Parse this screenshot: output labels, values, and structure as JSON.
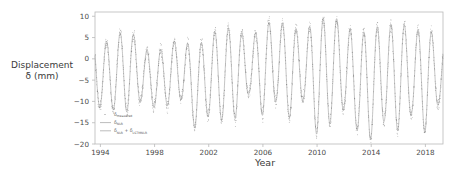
{
  "axes": {
    "ylabel_line1": "Displacement",
    "ylabel_line2": "δ (mm)",
    "xlabel": "Year",
    "yticks": [
      "10",
      "5",
      "0",
      "−5",
      "−10",
      "−15",
      "−20"
    ],
    "xticks": [
      "1994",
      "1998",
      "2002",
      "2006",
      "2010",
      "2014",
      "2018"
    ]
  },
  "legend": {
    "items": [
      {
        "base": "δ",
        "sub": "measured",
        "style": "dot"
      },
      {
        "base": "δ",
        "sub": "NLR",
        "style": "line"
      },
      {
        "base": "δ",
        "sub": "NLR",
        "extra": " + δ",
        "sub2": "LSTMNLR",
        "style": "line"
      }
    ]
  },
  "colors": {
    "axis": "#b9b9b9",
    "tick_text": "#4a4a4a",
    "label_text": "#3a3a3a",
    "fit_line": "#8d8d8d",
    "marker": "#6f6f6f",
    "background": "#ffffff"
  },
  "chart_data": {
    "type": "line",
    "title": "",
    "xlabel": "Year",
    "ylabel": "Displacement δ (mm)",
    "xlim": [
      1993.6,
      2019.3
    ],
    "ylim": [
      -20,
      11
    ],
    "grid": false,
    "legend_position": "lower-left-inside",
    "annual_cycles": [
      {
        "year": 1994,
        "peak": 3.8,
        "trough": -11.5
      },
      {
        "year": 1995,
        "peak": 4.5,
        "trough": -12.0
      },
      {
        "year": 1996,
        "peak": 8.0,
        "trough": -12.5
      },
      {
        "year": 1997,
        "peak": 3.0,
        "trough": -10.0
      },
      {
        "year": 1998,
        "peak": 1.0,
        "trough": -11.5
      },
      {
        "year": 1999,
        "peak": 3.5,
        "trough": -11.0
      },
      {
        "year": 2000,
        "peak": 5.0,
        "trough": -9.5
      },
      {
        "year": 2001,
        "peak": 2.0,
        "trough": -16.5
      },
      {
        "year": 2002,
        "peak": 6.0,
        "trough": -13.5
      },
      {
        "year": 2003,
        "peak": 7.0,
        "trough": -14.5
      },
      {
        "year": 2004,
        "peak": 7.5,
        "trough": -14.0
      },
      {
        "year": 2005,
        "peak": 4.5,
        "trough": -8.0
      },
      {
        "year": 2006,
        "peak": 8.0,
        "trough": -13.5
      },
      {
        "year": 2007,
        "peak": 9.2,
        "trough": -10.0
      },
      {
        "year": 2008,
        "peak": 7.5,
        "trough": -14.0
      },
      {
        "year": 2009,
        "peak": 6.5,
        "trough": -9.5
      },
      {
        "year": 2010,
        "peak": 9.0,
        "trough": -18.0
      },
      {
        "year": 2011,
        "peak": 10.2,
        "trough": -15.0
      },
      {
        "year": 2012,
        "peak": 8.5,
        "trough": -12.0
      },
      {
        "year": 2013,
        "peak": 5.0,
        "trough": -17.0
      },
      {
        "year": 2014,
        "peak": 8.0,
        "trough": -19.0
      },
      {
        "year": 2015,
        "peak": 7.0,
        "trough": -14.5
      },
      {
        "year": 2016,
        "peak": 9.5,
        "trough": -17.0
      },
      {
        "year": 2017,
        "peak": 6.0,
        "trough": -13.0
      },
      {
        "year": 2018,
        "peak": 8.0,
        "trough": -17.5
      },
      {
        "year": 2019,
        "peak": 4.0,
        "trough": -10.5
      }
    ],
    "series": [
      {
        "name": "δ_measured",
        "marker": "dot",
        "note": "individual epoch measurements scattered about the fit"
      },
      {
        "name": "δ_NLR",
        "marker": "line",
        "note": "nonlinear regression fit"
      },
      {
        "name": "δ_NLR + δ_LSTMNLR",
        "marker": "line",
        "note": "nonlinear regression plus LSTM residual correction"
      }
    ]
  }
}
